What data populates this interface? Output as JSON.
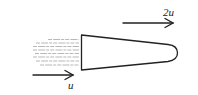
{
  "diagram": {
    "labels": {
      "outlet_velocity": "2u",
      "inlet_velocity": "u"
    },
    "colors": {
      "stroke": "#222222",
      "streamlines": "#9a9a9a",
      "background": "#ffffff"
    }
  }
}
